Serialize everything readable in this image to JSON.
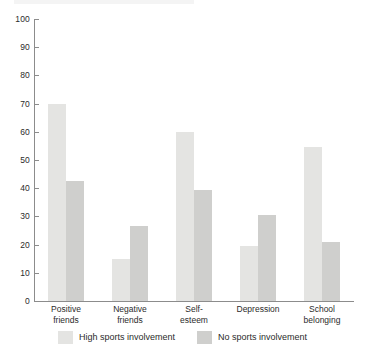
{
  "chart_data": {
    "type": "bar",
    "title": "",
    "subtitle": "",
    "xlabel": "",
    "ylabel": "",
    "ylim": [
      0,
      100
    ],
    "yticks": [
      0,
      10,
      20,
      30,
      40,
      50,
      60,
      70,
      80,
      90,
      100
    ],
    "ytick_labels": [
      "0",
      "10",
      "20",
      "30",
      "40",
      "50",
      "60",
      "70",
      "80",
      "90",
      "100"
    ],
    "grid": false,
    "legend_position": "bottom",
    "categories": [
      "Positive friends",
      "Negative friends",
      "Self-esteem",
      "Depression",
      "School belonging"
    ],
    "category_lines": [
      [
        "Positive",
        "friends"
      ],
      [
        "Negative",
        "friends"
      ],
      [
        "Self-",
        "esteem"
      ],
      [
        "Depression",
        ""
      ],
      [
        "School",
        "belonging"
      ]
    ],
    "series": [
      {
        "name": "High sports involvement",
        "color": "#e4e4e2",
        "values": [
          70,
          15,
          60,
          19.5,
          54.5
        ]
      },
      {
        "name": "No sports involvement",
        "color": "#cfcfcd",
        "values": [
          42.5,
          26.5,
          39.5,
          30.5,
          21
        ]
      }
    ],
    "annotations": []
  },
  "legend": {
    "items": [
      {
        "label": "High sports involvement",
        "swatch": "series-high"
      },
      {
        "label": "No sports involvement",
        "swatch": "series-none"
      }
    ]
  },
  "colors": {
    "axis": "#8c8c8c",
    "text": "#2b2b2b",
    "background": "#ffffff",
    "series_high": "#e4e4e2",
    "series_none": "#cfcfcd"
  }
}
